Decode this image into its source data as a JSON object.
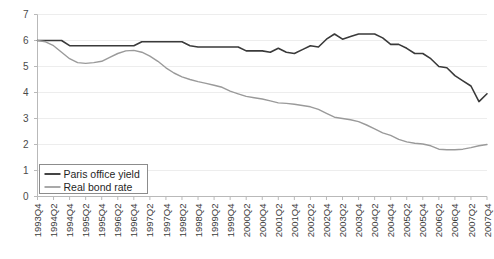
{
  "chart_data": {
    "type": "line",
    "title": "",
    "subtitle": "",
    "xlabel": "",
    "ylabel": "",
    "ylim": [
      0,
      7
    ],
    "yticks": [
      0,
      1,
      2,
      3,
      4,
      5,
      6,
      7
    ],
    "ytick_labels": [
      "0",
      "1",
      "2",
      "3",
      "4",
      "5",
      "6",
      "7"
    ],
    "grid": true,
    "grid_axis": "y",
    "legend_position": "lower-left",
    "x": [
      "1993Q4",
      "1994Q1",
      "1994Q2",
      "1994Q3",
      "1994Q4",
      "1995Q1",
      "1995Q2",
      "1995Q3",
      "1995Q4",
      "1996Q1",
      "1996Q2",
      "1996Q3",
      "1996Q4",
      "1997Q1",
      "1997Q2",
      "1997Q3",
      "1997Q4",
      "1998Q1",
      "1998Q2",
      "1998Q3",
      "1998Q4",
      "1999Q1",
      "1999Q2",
      "1999Q3",
      "1999Q4",
      "2000Q1",
      "2000Q2",
      "2000Q3",
      "2000Q4",
      "2001Q1",
      "2001Q2",
      "2001Q3",
      "2001Q4",
      "2002Q1",
      "2002Q2",
      "2002Q3",
      "2002Q4",
      "2003Q1",
      "2003Q2",
      "2003Q3",
      "2003Q4",
      "2004Q1",
      "2004Q2",
      "2004Q3",
      "2004Q4",
      "2005Q1",
      "2005Q2",
      "2005Q3",
      "2005Q4",
      "2006Q1",
      "2006Q2",
      "2006Q3",
      "2006Q4",
      "2007Q1",
      "2007Q2",
      "2007Q3",
      "2007Q4"
    ],
    "xtick_labels": [
      "1993Q4",
      "1994Q2",
      "1994Q4",
      "1995Q2",
      "1995Q4",
      "1996Q2",
      "1996Q4",
      "1997Q2",
      "1997Q4",
      "1998Q2",
      "1998Q4",
      "1999Q2",
      "1999Q4",
      "2000Q2",
      "2000Q4",
      "2001Q2",
      "2001Q4",
      "2002Q2",
      "2002Q4",
      "2003Q2",
      "2003Q4",
      "2004Q2",
      "2004Q4",
      "2005Q2",
      "2005Q4",
      "2006Q2",
      "2006Q4",
      "2007Q2",
      "2007Q4"
    ],
    "series": [
      {
        "name": "Paris office yield",
        "color": "#3a3a3a",
        "width": 1.6,
        "values": [
          6.0,
          6.0,
          6.0,
          6.0,
          5.8,
          5.8,
          5.8,
          5.8,
          5.8,
          5.8,
          5.8,
          5.8,
          5.8,
          5.95,
          5.95,
          5.95,
          5.95,
          5.95,
          5.95,
          5.8,
          5.75,
          5.75,
          5.75,
          5.75,
          5.75,
          5.75,
          5.6,
          5.6,
          5.6,
          5.55,
          5.7,
          5.55,
          5.5,
          5.65,
          5.8,
          5.75,
          6.05,
          6.25,
          6.05,
          6.15,
          6.25,
          6.25,
          6.25,
          6.1,
          5.85,
          5.85,
          5.7,
          5.5,
          5.5,
          5.3,
          5.0,
          4.95,
          4.65,
          4.45,
          4.25,
          3.65,
          3.95
        ]
      },
      {
        "name": "Real bond rate",
        "color": "#9a9a9a",
        "width": 1.4,
        "values": [
          6.0,
          5.95,
          5.8,
          5.55,
          5.3,
          5.15,
          5.12,
          5.15,
          5.2,
          5.35,
          5.5,
          5.6,
          5.62,
          5.55,
          5.4,
          5.2,
          4.95,
          4.75,
          4.6,
          4.5,
          4.42,
          4.35,
          4.28,
          4.2,
          4.05,
          3.95,
          3.85,
          3.8,
          3.75,
          3.68,
          3.6,
          3.58,
          3.55,
          3.5,
          3.45,
          3.35,
          3.2,
          3.05,
          3.0,
          2.95,
          2.88,
          2.75,
          2.6,
          2.45,
          2.35,
          2.2,
          2.1,
          2.05,
          2.02,
          1.95,
          1.82,
          1.8,
          1.8,
          1.82,
          1.88,
          1.95,
          2.0
        ]
      }
    ]
  }
}
